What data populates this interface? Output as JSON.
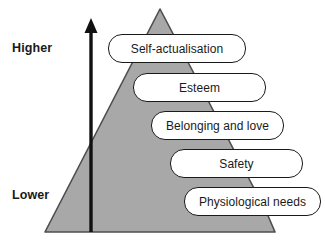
{
  "diagram": {
    "type": "pyramid-hierarchy",
    "axis": {
      "high_label": "Higher",
      "low_label": "Lower",
      "arrow_direction": "up",
      "arrow_icon": "up-arrow-icon"
    },
    "colors": {
      "pyramid_fill": "#a8a8a8",
      "pyramid_stroke": "#4d4d4d",
      "box_fill": "#ffffff",
      "box_stroke": "#1a1a1a",
      "text": "#1a1a1a",
      "background": "#ffffff"
    },
    "levels": [
      {
        "rank": 5,
        "label": "Self-actualisation",
        "tier": "highest"
      },
      {
        "rank": 4,
        "label": "Esteem",
        "tier": "high"
      },
      {
        "rank": 3,
        "label": "Belonging and love",
        "tier": "middle"
      },
      {
        "rank": 2,
        "label": "Safety",
        "tier": "low"
      },
      {
        "rank": 1,
        "label": "Physiological needs",
        "tier": "lowest"
      }
    ]
  }
}
